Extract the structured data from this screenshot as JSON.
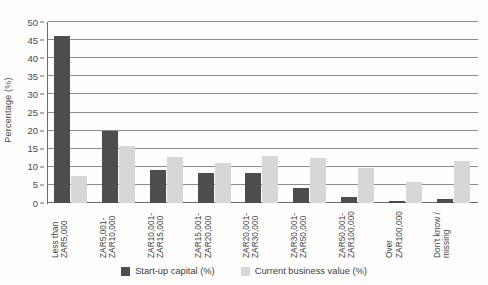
{
  "chart_data": {
    "type": "bar",
    "title": "",
    "subtitle": "",
    "xlabel": "",
    "ylabel": "Percentage (%)",
    "ylim": [
      0,
      50
    ],
    "ytick_step": 5,
    "yticks": [
      0,
      5,
      10,
      15,
      20,
      25,
      30,
      35,
      40,
      45,
      50
    ],
    "ytick_labels": [
      "0",
      "5",
      "10",
      "15",
      "20",
      "25",
      "30",
      "35",
      "40",
      "45",
      "50"
    ],
    "grid": true,
    "grid_axis": "y",
    "legend_position": "bottom",
    "categories": [
      "Less than ZAR5,000",
      "ZAR5,001-ZAR10,000",
      "ZAR10,001-ZAR15,000",
      "ZAR15,001-ZAR20,000",
      "ZAR20,001-ZAR30,000",
      "ZAR30,001-ZAR50,000",
      "ZAR50,001-ZAR100,000",
      "Over ZAR100,000",
      "Don't know / missing"
    ],
    "category_lines": [
      [
        "Less than",
        "ZAR5,000"
      ],
      [
        "ZAR5,001-",
        "ZAR10,000"
      ],
      [
        "ZAR10,001-",
        "ZAR15,000"
      ],
      [
        "ZAR15,001-",
        "ZAR20,000"
      ],
      [
        "ZAR20,001-",
        "ZAR30,000"
      ],
      [
        "ZAR30,001-",
        "ZAR50,000"
      ],
      [
        "ZAR50,001-",
        "ZAR100,000"
      ],
      [
        "Over",
        "ZAR100,000"
      ],
      [
        "Don't know /",
        "missing"
      ]
    ],
    "series": [
      {
        "name": "Start-up capital (%)",
        "color": "#4d4d4d",
        "values": [
          46.2,
          20.0,
          9.0,
          8.3,
          8.3,
          4.2,
          1.6,
          0.5,
          1.2
        ]
      },
      {
        "name": "Current business value (%)",
        "color": "#d7d7d7",
        "values": [
          7.5,
          15.7,
          12.8,
          11.0,
          13.0,
          12.4,
          9.8,
          5.8,
          11.5
        ]
      }
    ]
  },
  "legend": {
    "items": [
      {
        "label": "Start-up capital (%)",
        "color": "#4d4d4d"
      },
      {
        "label": "Current business value (%)",
        "color": "#d7d7d7"
      }
    ]
  },
  "axes": {
    "y_title": "Percentage (%)"
  }
}
